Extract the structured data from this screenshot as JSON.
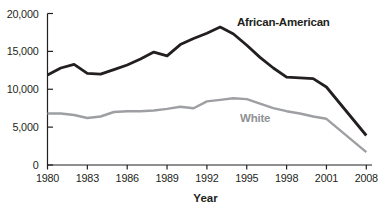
{
  "chart_data": {
    "type": "line",
    "title": "",
    "xlabel": "Year",
    "ylabel": "",
    "ylim": [
      0,
      20000
    ],
    "grid": false,
    "legend_position": "inline-labels-on-lines",
    "x_axis_note": "ticks evenly spaced; final interval 2001-2008 is compressed (7 years in one tick step)",
    "x_tick_years": [
      1980,
      1983,
      1986,
      1989,
      1992,
      1995,
      1998,
      2001,
      2008
    ],
    "x_tick_labels": [
      "1980",
      "1983",
      "1986",
      "1989",
      "1992",
      "1995",
      "1998",
      "2001",
      "2008"
    ],
    "y_tick_values": [
      0,
      5000,
      10000,
      15000,
      20000
    ],
    "y_tick_labels": [
      "0",
      "5,000",
      "10,000",
      "15,000",
      "20,000"
    ],
    "years": [
      1980,
      1981,
      1982,
      1983,
      1984,
      1985,
      1986,
      1987,
      1988,
      1989,
      1990,
      1991,
      1992,
      1993,
      1994,
      1995,
      1996,
      1997,
      1998,
      1999,
      2000,
      2001,
      2008
    ],
    "series": [
      {
        "name": "African-American",
        "color": "#231f20",
        "label_color": "#231f20",
        "values": [
          11900,
          12800,
          13300,
          12100,
          12000,
          12600,
          13200,
          14000,
          14900,
          14400,
          15900,
          16700,
          17400,
          18200,
          17300,
          15800,
          14200,
          12800,
          11600,
          11500,
          11400,
          10300,
          3900
        ]
      },
      {
        "name": "White",
        "color": "#9d9fa2",
        "label_color": "#8f9194",
        "values": [
          6800,
          6800,
          6600,
          6200,
          6400,
          7000,
          7100,
          7100,
          7200,
          7400,
          7700,
          7500,
          8400,
          8600,
          8800,
          8700,
          8100,
          7500,
          7100,
          6800,
          6400,
          6100,
          1700
        ]
      }
    ],
    "colors": {
      "axis": "#231f20",
      "text": "#231f20",
      "background": "#ffffff"
    }
  }
}
